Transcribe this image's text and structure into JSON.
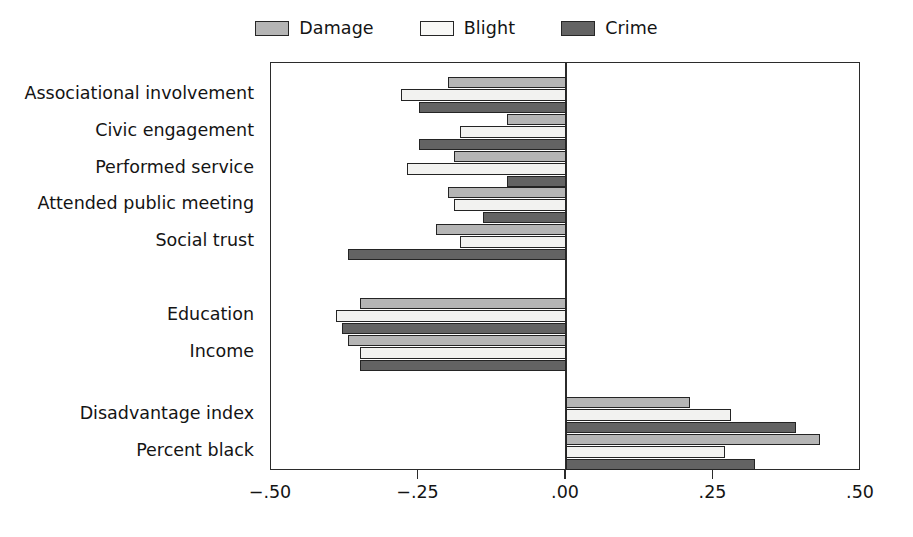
{
  "legend": {
    "position": "top-center",
    "entries": [
      {
        "label": "Damage",
        "key": "damage",
        "color": "#b5b5b5"
      },
      {
        "label": "Blight",
        "key": "blight",
        "color": "#f2f2f0"
      },
      {
        "label": "Crime",
        "key": "crime",
        "color": "#636363"
      }
    ]
  },
  "axis": {
    "tick_labels": [
      "−.50",
      "−.25",
      ".00",
      ".25",
      ".50"
    ],
    "tick_values": [
      -0.5,
      -0.25,
      0.0,
      0.25,
      0.5
    ]
  },
  "chart_data": {
    "type": "bar",
    "orientation": "horizontal",
    "title": "",
    "subtitle": "",
    "xlabel": "",
    "ylabel": "",
    "xlim": [
      -0.5,
      0.5
    ],
    "grid": false,
    "legend_position": "top-center",
    "zero_reference_line": 0.0,
    "categories": [
      "Associational involvement",
      "Civic engagement",
      "Performed service",
      "Attended public meeting",
      "Social trust",
      "Education",
      "Income",
      "Disadvantage index",
      "Percent black"
    ],
    "category_groups": [
      {
        "name": "social-capital",
        "categories": [
          "Associational involvement",
          "Civic engagement",
          "Performed service",
          "Attended public meeting",
          "Social trust"
        ]
      },
      {
        "name": "socioeconomic-status",
        "categories": [
          "Education",
          "Income"
        ]
      },
      {
        "name": "structural-disadvantage",
        "categories": [
          "Disadvantage index",
          "Percent black"
        ]
      }
    ],
    "series": [
      {
        "name": "Damage",
        "color": "#b5b5b5",
        "values": [
          -0.2,
          -0.1,
          -0.19,
          -0.2,
          -0.22,
          -0.35,
          -0.37,
          0.21,
          0.43
        ]
      },
      {
        "name": "Blight",
        "color": "#f2f2f0",
        "values": [
          -0.28,
          -0.18,
          -0.27,
          -0.19,
          -0.18,
          -0.39,
          -0.35,
          0.28,
          0.27
        ]
      },
      {
        "name": "Crime",
        "color": "#636363",
        "values": [
          -0.25,
          -0.25,
          -0.1,
          -0.14,
          -0.37,
          -0.38,
          -0.35,
          0.39,
          0.32
        ]
      }
    ],
    "tick_labels": [
      "−.50",
      "−.25",
      ".00",
      ".25",
      ".50"
    ]
  }
}
